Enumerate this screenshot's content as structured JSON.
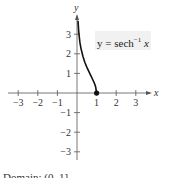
{
  "chart_data": {
    "type": "line",
    "title": "",
    "function_label": {
      "prefix": "y = sech",
      "superscript": "−1",
      "variable": "x"
    },
    "xlabel": "x",
    "ylabel": "y",
    "xlim": [
      -3.5,
      3.7
    ],
    "ylim": [
      -3.5,
      4.0
    ],
    "x_ticks": [
      -3,
      -2,
      -1,
      1,
      2,
      3
    ],
    "x_tick_labels": [
      "−3",
      "−2",
      "−1",
      "1",
      "2",
      "3"
    ],
    "y_ticks": [
      -3,
      -2,
      -1,
      1,
      2,
      3
    ],
    "y_tick_labels": [
      "−3",
      "−2",
      "−1",
      "1",
      "2",
      "3"
    ],
    "grid": false,
    "series": [
      {
        "name": "y = sech^-1 x",
        "x": [
          0.05,
          0.08,
          0.1,
          0.15,
          0.2,
          0.3,
          0.4,
          0.5,
          0.6,
          0.7,
          0.8,
          0.9,
          0.95,
          1.0
        ],
        "y": [
          3.69,
          3.22,
          2.99,
          2.58,
          2.29,
          1.87,
          1.57,
          1.32,
          1.1,
          0.9,
          0.69,
          0.47,
          0.32,
          0.0
        ]
      }
    ],
    "points": [
      {
        "x": 1,
        "y": 0,
        "style": "filled"
      }
    ]
  },
  "caption": "Domain: (0, 1]"
}
